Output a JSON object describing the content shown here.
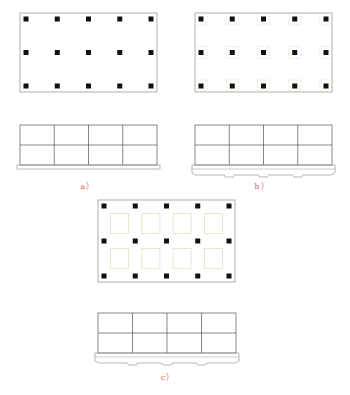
{
  "figure": {
    "panels": [
      {
        "id": "a",
        "label": "a）",
        "plan": {
          "x": 20,
          "y": 13,
          "w": 137,
          "h": 79,
          "cols": 5,
          "rows": 3,
          "footings": "none"
        },
        "elevation": {
          "x": 20,
          "y": 125,
          "w": 137,
          "h": 40,
          "bays": 4,
          "stories": 2,
          "foundation": "flat-slab"
        },
        "label_pos": {
          "x": 88,
          "y": 180
        }
      },
      {
        "id": "b",
        "label": "b）",
        "plan": {
          "x": 195,
          "y": 13,
          "w": 137,
          "h": 79,
          "cols": 5,
          "rows": 3,
          "footings": "column-pads"
        },
        "elevation": {
          "x": 195,
          "y": 125,
          "w": 137,
          "h": 40,
          "bays": 4,
          "stories": 2,
          "foundation": "ribbed-slab"
        },
        "label_pos": {
          "x": 262,
          "y": 180
        }
      },
      {
        "id": "c",
        "label": "c）",
        "plan": {
          "x": 98,
          "y": 200,
          "w": 137,
          "h": 82,
          "cols": 5,
          "rows": 3,
          "footings": "bay-recesses"
        },
        "elevation": {
          "x": 98,
          "y": 313,
          "w": 138,
          "h": 40,
          "bays": 4,
          "stories": 2,
          "foundation": "ribbed-slab"
        },
        "label_pos": {
          "x": 168,
          "y": 371
        }
      }
    ],
    "colors": {
      "outline": "#9a9a9a",
      "column": "#111111",
      "footing": "#e4d9b8",
      "label": "#e8604a"
    }
  }
}
